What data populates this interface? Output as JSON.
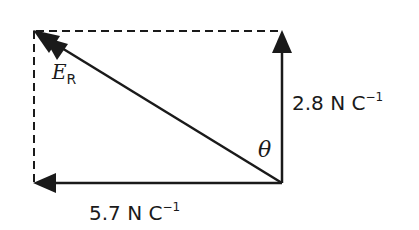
{
  "diagram": {
    "vectors": {
      "vertical": {
        "label_value": "2.8",
        "label_unit": "N C",
        "label_exp": "−1"
      },
      "horizontal": {
        "label_value": "5.7",
        "label_unit": "N C",
        "label_exp": "−1"
      },
      "resultant": {
        "symbol": "E",
        "subscript": "R"
      }
    },
    "angle": {
      "symbol": "θ"
    },
    "colors": {
      "line": "#1a1a1a",
      "background": "#ffffff"
    }
  }
}
